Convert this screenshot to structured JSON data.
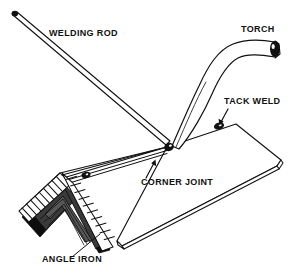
{
  "figure": {
    "background_color": "#ffffff",
    "ink_color": "#111111",
    "angle_iron_color": "#3a3a3a"
  },
  "labels": {
    "welding_rod": "WELDING ROD",
    "torch": "TORCH",
    "tack_weld": "TACK WELD",
    "corner_joint": "CORNER JOINT",
    "angle_iron": "ANGLE IRON"
  },
  "parts": {
    "welding_rod_name": "welding-rod",
    "torch_name": "torch",
    "torch_nozzle_name": "torch-nozzle",
    "weld_puddle_name": "weld-puddle",
    "tack_weld_upper_name": "tack-weld-bead-upper",
    "tack_weld_lower_name": "tack-weld-bead-lower",
    "right_plate_name": "right-steel-plate",
    "left_plate_name": "left-steel-plate",
    "angle_iron_name": "angle-iron-fixture"
  },
  "label_positions": {
    "welding_rod": {
      "x": 49,
      "y": 36
    },
    "torch": {
      "x": 241,
      "y": 32
    },
    "tack_weld": {
      "x": 224,
      "y": 104
    },
    "corner_joint": {
      "x": 141,
      "y": 185
    },
    "angle_iron": {
      "x": 42,
      "y": 262
    }
  }
}
